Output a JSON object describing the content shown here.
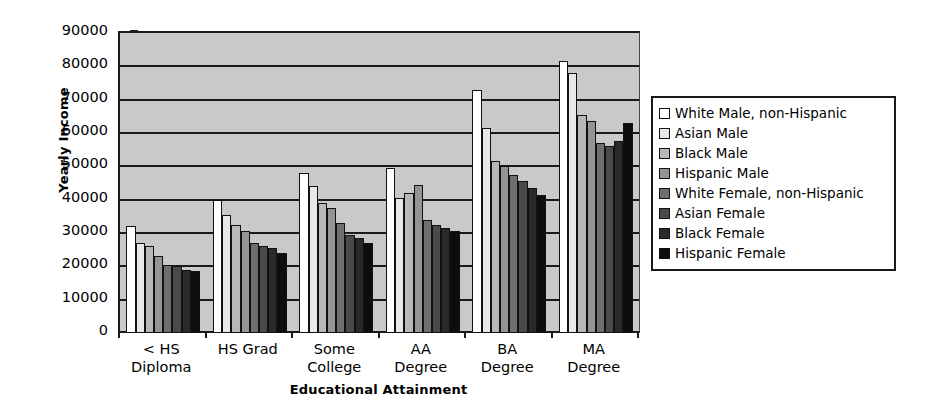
{
  "chart_data": {
    "type": "bar",
    "title": "",
    "xlabel": "Educational Attainment",
    "ylabel": "Yearly Income",
    "categories": [
      "< HS Diploma",
      "HS Grad",
      "Some College",
      "AA Degree",
      "BA Degree",
      "MA Degree"
    ],
    "category_lines": [
      [
        "< HS",
        "Diploma"
      ],
      [
        "HS Grad",
        ""
      ],
      [
        "Some",
        "College"
      ],
      [
        "AA",
        "Degree"
      ],
      [
        "BA",
        "Degree"
      ],
      [
        "MA",
        "Degree"
      ]
    ],
    "ylim": [
      0,
      90000
    ],
    "ytick_labels": [
      "90000",
      "80000",
      "70000",
      "60000",
      "50000",
      "40000",
      "30000",
      "20000",
      "10000",
      "0"
    ],
    "ytick_values": [
      90000,
      80000,
      70000,
      60000,
      50000,
      40000,
      30000,
      20000,
      10000,
      0
    ],
    "grid": true,
    "legend_position": "right",
    "plot_background": "#c9c9c9",
    "series": [
      {
        "name": "White Male, non-Hispanic",
        "color": "#ffffff",
        "values": [
          32000,
          40000,
          48000,
          49500,
          73000,
          81500
        ]
      },
      {
        "name": "Asian Male",
        "color": "#e8e8e8",
        "values": [
          27000,
          35500,
          44000,
          40500,
          61500,
          78000
        ]
      },
      {
        "name": "Black Male",
        "color": "#b8b8b8",
        "values": [
          26000,
          32500,
          39000,
          42000,
          51500,
          65500
        ]
      },
      {
        "name": "Hispanic Male",
        "color": "#949494",
        "values": [
          23000,
          30500,
          37500,
          44500,
          50000,
          63500
        ]
      },
      {
        "name": "White Female, non-Hispanic",
        "color": "#6e6e6e",
        "values": [
          20500,
          27000,
          33000,
          34000,
          47500,
          57000
        ]
      },
      {
        "name": "Asian Female",
        "color": "#4a4a4a",
        "values": [
          20000,
          26000,
          29500,
          32500,
          45500,
          56000
        ]
      },
      {
        "name": "Black Female",
        "color": "#2a2a2a",
        "values": [
          19000,
          25500,
          28500,
          31500,
          43500,
          57500
        ]
      },
      {
        "name": "Hispanic Female",
        "color": "#0d0d0d",
        "values": [
          18500,
          24000,
          27000,
          30500,
          41500,
          63000
        ]
      }
    ]
  }
}
